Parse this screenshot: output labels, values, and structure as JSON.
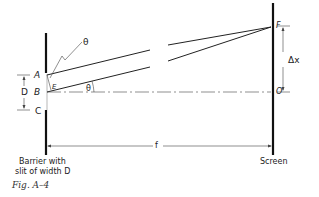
{
  "figure": {
    "caption": "Fig. A–4",
    "labels": {
      "theta_top": "θ",
      "theta_angle": "θ",
      "point_a": "A",
      "point_b": "B",
      "point_c": "C",
      "point_e": "E",
      "point_f": "F",
      "point_o": "O",
      "slit_width": "D",
      "delta_x": "Δx",
      "distance": "f",
      "barrier_line1": "Barrier with",
      "barrier_line2": "slit of width D",
      "screen": "Screen"
    }
  }
}
